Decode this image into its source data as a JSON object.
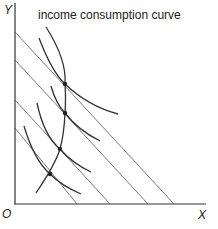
{
  "diagram": {
    "title": "income consumption curve",
    "axes": {
      "y_label": "Y",
      "x_label": "X",
      "origin_label": "O"
    },
    "budget_lines": [
      {
        "name": "budget-line-1",
        "y_intercept_px": 32,
        "x_intercept_px": 174
      },
      {
        "name": "budget-line-2",
        "y_intercept_px": 60,
        "x_intercept_px": 148
      },
      {
        "name": "budget-line-3",
        "y_intercept_px": 100,
        "x_intercept_px": 110
      },
      {
        "name": "budget-line-4",
        "y_intercept_px": 128,
        "x_intercept_px": 77
      }
    ],
    "equilibrium_points": [
      {
        "x": 65,
        "y": 84
      },
      {
        "x": 65,
        "y": 113
      },
      {
        "x": 60,
        "y": 149
      },
      {
        "x": 50,
        "y": 174
      }
    ],
    "indifference_curve_count": 4,
    "colors": {
      "line": "#333333",
      "budget": "#555555",
      "background": "#ffffff"
    }
  }
}
